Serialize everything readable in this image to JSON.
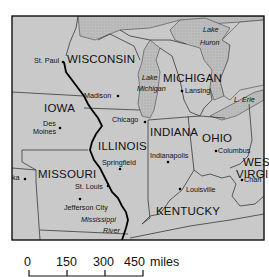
{
  "map": {
    "colors": {
      "land": "#c8c8c8",
      "lake": "#b8b8b8",
      "border": "#333333",
      "river": "#000000",
      "frame": "#111111"
    },
    "states": {
      "wisconsin": "WISCONSIN",
      "michigan": "MICHIGAN",
      "iowa": "IOWA",
      "illinois": "ILLINOIS",
      "indiana": "INDIANA",
      "ohio": "OHIO",
      "missouri": "MISSOURI",
      "kentucky": "KENTUCKY",
      "west_virginia_1": "WES",
      "west_virginia_2": "VIRGI"
    },
    "cities": {
      "st_paul": "St. Paul",
      "madison": "Madison",
      "lansing": "Lansing",
      "des_moines_1": "Des",
      "des_moines_2": "Moines",
      "chicago": "Chicago",
      "springfield": "Springfield",
      "indianapolis": "Indianapolis",
      "columbus": "Columbus",
      "charleston": "Charl",
      "st_louis": "St. Louis",
      "jefferson_city": "Jefferson City",
      "louisville": "Louisville",
      "topeka": "ka"
    },
    "water": {
      "lake_huron_1": "Lake",
      "lake_huron_2": "Huron",
      "lake_michigan_1": "Lake",
      "lake_michigan_2": "Michigan",
      "lake_erie": "L. Erie",
      "river_1": "Mississippi",
      "river_2": "River"
    }
  },
  "scale_bar": {
    "ticks": [
      "0",
      "150",
      "300",
      "450"
    ],
    "unit": "miles"
  }
}
